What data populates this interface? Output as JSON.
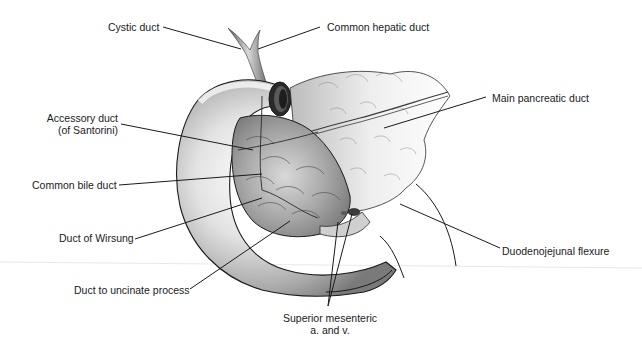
{
  "figure": {
    "colors": {
      "background": "#ffffff",
      "outline": "#1a1a1a",
      "leader_line": "#1a1a1a",
      "label_text": "#1a1a1a",
      "tissue_light": "#f2f2f2",
      "tissue_mid": "#bdbdbd",
      "tissue_dark": "#6e6e6e",
      "scan_line": "#e6e6e6"
    }
  },
  "labels": {
    "cystic_duct": "Cystic duct",
    "common_hepatic_duct": "Common hepatic duct",
    "main_pancreatic_duct": "Main pancreatic duct",
    "accessory_duct_line1": "Accessory duct",
    "accessory_duct_line2": "(of Santorini)",
    "common_bile_duct": "Common bile duct",
    "duct_of_wirsung": "Duct of Wirsung",
    "duct_to_uncinate": "Duct to uncinate process",
    "superior_mesenteric_line1": "Superior mesenteric",
    "superior_mesenteric_line2": "a. and v.",
    "duodenojejunal_flexure": "Duodenojejunal flexure"
  }
}
